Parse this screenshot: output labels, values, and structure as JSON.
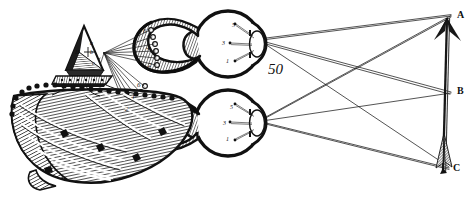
{
  "figure": {
    "number": "50",
    "caption_text": "50"
  },
  "object": {
    "name": "arrow",
    "points": [
      {
        "label": "A",
        "desc": "arrow-tip-top",
        "x": 452,
        "y": 16
      },
      {
        "label": "B",
        "desc": "arrow-middle",
        "x": 452,
        "y": 93
      },
      {
        "label": "C",
        "desc": "arrow-fletching-bottom",
        "x": 450,
        "y": 168
      }
    ]
  },
  "eyes": [
    {
      "name": "upper-eye",
      "retina_labels": [
        {
          "label": "5",
          "x": 232,
          "y": 22
        },
        {
          "label": "3",
          "x": 222,
          "y": 40
        },
        {
          "label": "1",
          "x": 226,
          "y": 58
        }
      ]
    },
    {
      "name": "lower-eye",
      "retina_labels": [
        {
          "label": "5",
          "x": 230,
          "y": 104
        },
        {
          "label": "3",
          "x": 223,
          "y": 120
        },
        {
          "label": "1",
          "x": 226,
          "y": 136
        }
      ]
    }
  ],
  "nerve_tracts": [
    {
      "name": "upper-optic-tract",
      "labels": [
        {
          "label": "6",
          "x": 143,
          "y": 30
        },
        {
          "label": "4",
          "x": 146,
          "y": 47
        },
        {
          "label": "2",
          "x": 148,
          "y": 65
        }
      ]
    },
    {
      "name": "lower-optic-tract",
      "labels": [
        {
          "label": "6",
          "x": 136,
          "y": 86
        },
        {
          "label": "4",
          "x": 131,
          "y": 98
        },
        {
          "label": "2",
          "x": 126,
          "y": 110
        }
      ]
    }
  ],
  "pineal": {
    "name": "pineal-gland",
    "labels": [
      {
        "label": "a",
        "x": 93,
        "y": 43
      },
      {
        "label": "H",
        "x": 79,
        "y": 52
      },
      {
        "label": "b",
        "x": 92,
        "y": 52
      },
      {
        "label": "c",
        "x": 94,
        "y": 63
      }
    ]
  },
  "colors": {
    "ink": "#141414",
    "paper": "#ffffff",
    "wash": "#5c5c5c"
  }
}
